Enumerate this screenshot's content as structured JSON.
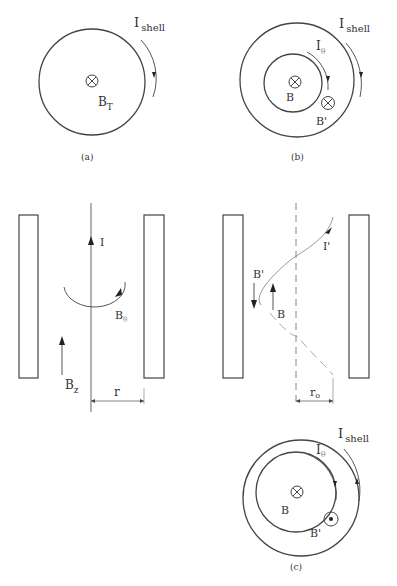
{
  "panel_a": {
    "caption": "(a)",
    "shell_current": {
      "main": "I",
      "sub": "shell"
    },
    "field": {
      "main": "B",
      "sub": "T"
    },
    "field_symbol": "into-page-icon"
  },
  "panel_b": {
    "caption": "(b)",
    "shell_current": {
      "main": "I",
      "sub": "shell"
    },
    "inner_current": {
      "main": "I",
      "sub": "θ"
    },
    "field_inner": "B",
    "field_induced": "B'",
    "field_symbol": "into-page-icon"
  },
  "panel_straight": {
    "current": "I",
    "azimuthal_field": {
      "main": "B",
      "sub": "θ"
    },
    "axial_field": {
      "main": "B",
      "sub": "z"
    },
    "radius": "r"
  },
  "panel_helical": {
    "current": "I'",
    "field_reversed": "B'",
    "field": "B",
    "radius": {
      "main": "r",
      "sub": "o"
    }
  },
  "panel_c": {
    "caption": "(c)",
    "shell_current": {
      "main": "I",
      "sub": "shell"
    },
    "inner_current": {
      "main": "I",
      "sub": "θ"
    },
    "field_inner": "B",
    "field_induced": "B'",
    "field_symbol_inner": "into-page-icon",
    "field_symbol_induced": "out-of-page-icon"
  },
  "colors": {
    "line": "#444444",
    "light_line": "#999999",
    "text": "#333333",
    "background": "#ffffff"
  }
}
